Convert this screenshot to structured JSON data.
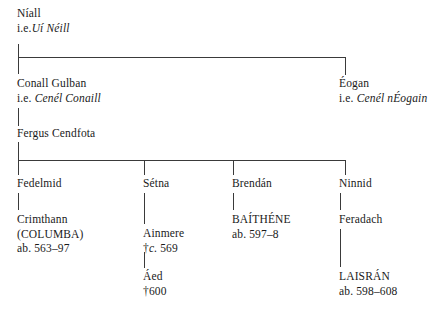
{
  "chart": {
    "line_color": "#3a3a3a",
    "text_color": "#1a1a1a",
    "background": "#ffffff"
  },
  "nodes": {
    "niall": {
      "name": "Níall",
      "gloss_prefix": "i.e.",
      "gloss": "Uí Néill"
    },
    "conall": {
      "name": "Conall Gulban",
      "gloss_prefix": "i.e.",
      "gloss": "Cenél Conaill"
    },
    "eogan": {
      "name": "Éogan",
      "gloss_prefix": "i.e.",
      "gloss": "Cenél nÉogain"
    },
    "fergus": {
      "name": "Fergus Cendfota"
    },
    "fedelmid": {
      "name": "Fedelmid"
    },
    "setna": {
      "name": "Sétna"
    },
    "brendan": {
      "name": "Brendán"
    },
    "ninnid": {
      "name": "Ninnid"
    },
    "crimthann": {
      "name": "Crimthann",
      "alias": "(COLUMBA)",
      "dates": "ab. 563–97"
    },
    "ainmere": {
      "name": "Ainmere",
      "death_mark": "†",
      "circa": "c.",
      "year": " 569"
    },
    "baithene": {
      "name": "BAÍTHÉNE",
      "dates": "ab. 597–8"
    },
    "feradach": {
      "name": "Feradach"
    },
    "aed": {
      "name": "Áed",
      "dates": "†600"
    },
    "laisran": {
      "name": "LAISRÁN",
      "dates": "ab. 598–608"
    }
  }
}
